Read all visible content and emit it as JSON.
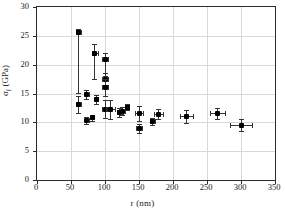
{
  "chart_data": {
    "type": "scatter",
    "title": "",
    "xlabel": "r (nm)",
    "ylabel": "σf (GPa)",
    "ylabel_main": "σ",
    "ylabel_sub": "f",
    "ylabel_unit": " (GPa)",
    "xlim": [
      0,
      350
    ],
    "ylim": [
      0,
      30
    ],
    "xticks": [
      0,
      50,
      100,
      150,
      200,
      250,
      300,
      350
    ],
    "yticks": [
      0,
      5,
      10,
      15,
      20,
      25,
      30
    ],
    "grid": "both",
    "legend": "none",
    "marker": "filled-square",
    "error_bars": "x and y",
    "points": [
      {
        "x": 61,
        "y": 25.5,
        "yerr_lo": 10.4,
        "yerr_hi": 0.6,
        "xerr": 3
      },
      {
        "x": 61,
        "y": 13.1,
        "yerr_lo": 1.5,
        "yerr_hi": 1.5,
        "xerr": 4
      },
      {
        "x": 73,
        "y": 14.8,
        "yerr_lo": 0.8,
        "yerr_hi": 0.8,
        "xerr": 3
      },
      {
        "x": 73,
        "y": 10.3,
        "yerr_lo": 0.6,
        "yerr_hi": 0.6,
        "xerr": 3
      },
      {
        "x": 81,
        "y": 10.8,
        "yerr_lo": 0.5,
        "yerr_hi": 0.5,
        "xerr": 3
      },
      {
        "x": 85,
        "y": 22.0,
        "yerr_lo": 4.5,
        "yerr_hi": 1.5,
        "xerr": 4
      },
      {
        "x": 87,
        "y": 14.0,
        "yerr_lo": 0.8,
        "yerr_hi": 0.8,
        "xerr": 3
      },
      {
        "x": 100,
        "y": 20.9,
        "yerr_lo": 2.9,
        "yerr_hi": 1.2,
        "xerr": 5
      },
      {
        "x": 100,
        "y": 17.4,
        "yerr_lo": 1.0,
        "yerr_hi": 1.2,
        "xerr": 4
      },
      {
        "x": 100,
        "y": 16.0,
        "yerr_lo": 1.5,
        "yerr_hi": 1.5,
        "xerr": 4
      },
      {
        "x": 100,
        "y": 12.3,
        "yerr_lo": 1.6,
        "yerr_hi": 1.6,
        "xerr": 4
      },
      {
        "x": 108,
        "y": 12.2,
        "yerr_lo": 1.7,
        "yerr_hi": 1.7,
        "xerr": 6
      },
      {
        "x": 122,
        "y": 11.7,
        "yerr_lo": 0.8,
        "yerr_hi": 0.8,
        "xerr": 4
      },
      {
        "x": 126,
        "y": 11.9,
        "yerr_lo": 0.7,
        "yerr_hi": 0.7,
        "xerr": 3
      },
      {
        "x": 133,
        "y": 12.6,
        "yerr_lo": 0.5,
        "yerr_hi": 0.5,
        "xerr": 3
      },
      {
        "x": 150,
        "y": 11.6,
        "yerr_lo": 1.3,
        "yerr_hi": 1.3,
        "xerr": 6
      },
      {
        "x": 150,
        "y": 8.9,
        "yerr_lo": 0.8,
        "yerr_hi": 0.8,
        "xerr": 5
      },
      {
        "x": 170,
        "y": 10.2,
        "yerr_lo": 0.6,
        "yerr_hi": 0.6,
        "xerr": 4
      },
      {
        "x": 179,
        "y": 11.4,
        "yerr_lo": 0.9,
        "yerr_hi": 0.9,
        "xerr": 7
      },
      {
        "x": 220,
        "y": 11.0,
        "yerr_lo": 1.1,
        "yerr_hi": 1.1,
        "xerr": 9
      },
      {
        "x": 265,
        "y": 11.5,
        "yerr_lo": 0.9,
        "yerr_hi": 0.9,
        "xerr": 11
      },
      {
        "x": 300,
        "y": 9.5,
        "yerr_lo": 1.0,
        "yerr_hi": 1.0,
        "xerr": 16
      }
    ]
  }
}
